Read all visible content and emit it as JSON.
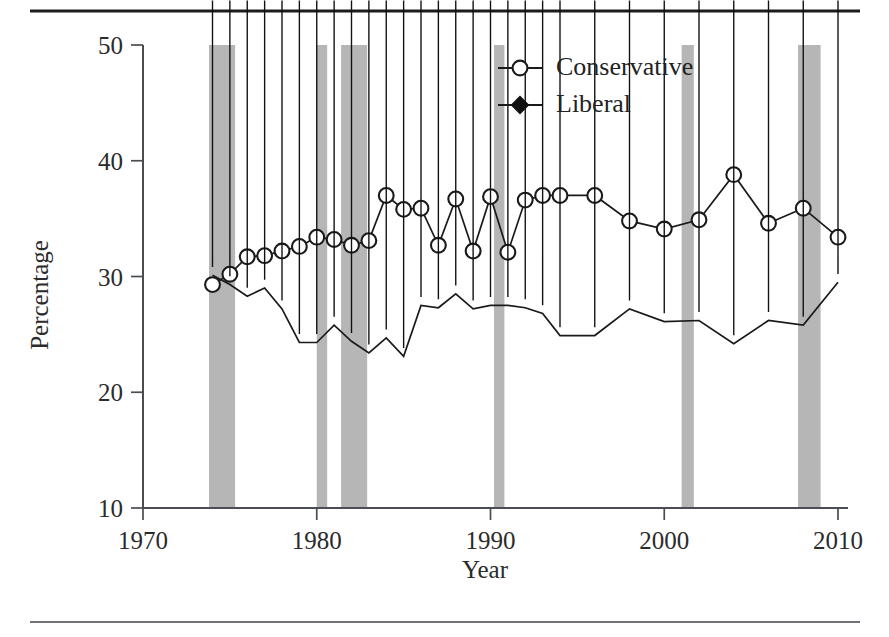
{
  "figure": {
    "top_rule_label": "top-divider",
    "bottom_rule_label": "bottom-divider"
  },
  "chart_data": {
    "type": "line",
    "title": "",
    "subtitle": "",
    "xlabel": "Year",
    "ylabel": "Percentage",
    "xlim": [
      1970,
      2010
    ],
    "ylim": [
      10,
      50
    ],
    "xticks": [
      1970,
      1980,
      1990,
      2000,
      2010
    ],
    "xtick_labels": [
      "1970",
      "1980",
      "1990",
      "2000",
      "2010"
    ],
    "yticks": [
      10,
      20,
      30,
      40,
      50
    ],
    "ytick_labels": [
      "10",
      "20",
      "30",
      "40",
      "50"
    ],
    "grid": false,
    "legend_position": "top-center-right",
    "x": [
      1974,
      1975,
      1976,
      1977,
      1978,
      1979,
      1980,
      1981,
      1982,
      1983,
      1984,
      1985,
      1986,
      1987,
      1988,
      1989,
      1990,
      1991,
      1992,
      1993,
      1994,
      1996,
      1998,
      2000,
      2002,
      2004,
      2006,
      2008,
      2010
    ],
    "series": [
      {
        "name": "Conservative",
        "marker": "open-circle",
        "color": "#1a1a1a",
        "values": [
          29.3,
          30.2,
          31.7,
          31.8,
          32.2,
          32.6,
          33.4,
          33.2,
          32.7,
          33.1,
          37.0,
          35.8,
          35.9,
          32.7,
          36.7,
          32.2,
          36.9,
          32.1,
          36.6,
          37.0,
          37.0,
          37.0,
          34.8,
          34.1,
          34.9,
          38.8,
          34.6,
          35.9,
          33.4
        ]
      },
      {
        "name": "Liberal",
        "marker": "filled-diamond",
        "color": "#111111",
        "values": [
          30.1,
          29.3,
          28.3,
          29.0,
          27.2,
          24.3,
          24.3,
          25.8,
          24.4,
          23.4,
          24.7,
          23.1,
          27.5,
          27.3,
          28.5,
          27.2,
          27.5,
          27.5,
          27.3,
          26.8,
          24.9,
          24.9,
          27.2,
          26.1,
          26.2,
          24.2,
          26.2,
          25.8,
          29.5
        ]
      }
    ],
    "shaded_regions": {
      "name": "recession-bands",
      "color": "#b0b0b0",
      "ranges": [
        [
          1973.8,
          1975.3
        ],
        [
          1980.0,
          1980.6
        ],
        [
          1981.4,
          1982.9
        ],
        [
          1990.2,
          1990.8
        ],
        [
          2001.0,
          2001.7
        ],
        [
          2007.7,
          2009.0
        ]
      ]
    }
  },
  "legend": {
    "items": [
      {
        "label": "Conservative",
        "marker": "open-circle"
      },
      {
        "label": "Liberal",
        "marker": "filled-diamond"
      }
    ]
  }
}
